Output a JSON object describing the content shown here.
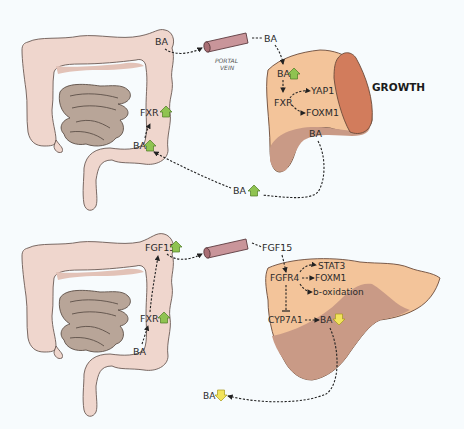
{
  "figure": {
    "top_panel": {
      "intestine_labels": {
        "ba_top": "BA",
        "fxr": "FXR",
        "ba_lower": "BA"
      },
      "portal_vein": {
        "line1": "PORTAL",
        "line2": "VEIN"
      },
      "vein_output_label": "BA",
      "liver_labels": {
        "ba_in": "BA",
        "fxr": "FXR",
        "yap1": "YAP1",
        "foxm1": "FOXM1",
        "ba_out": "BA"
      },
      "recirculation_label": "BA",
      "outcome": "GROWTH",
      "indicators": {
        "intestine_fxr": "up",
        "intestine_ba": "up",
        "liver_ba": "up",
        "recirculating_ba": "up"
      }
    },
    "bottom_panel": {
      "intestine_labels": {
        "fgf15": "FGF15",
        "fxr": "FXR",
        "ba": "BA"
      },
      "vein_output_label": "FGF15",
      "liver_labels": {
        "fgfr4": "FGFR4",
        "stat3": "STAT3",
        "foxm1": "FOXM1",
        "b_oxidation": "b-oxidation",
        "cyp7a1": "CYP7A1",
        "ba": "BA"
      },
      "excretion_label": "BA",
      "indicators": {
        "fgf15": "up",
        "fxr": "up",
        "liver_ba": "down",
        "excreted_ba": "down"
      }
    },
    "icons": [
      "colon-icon",
      "small-intestine-icon",
      "portal-vein-icon",
      "liver-icon",
      "up-arrow-icon",
      "down-arrow-icon",
      "inhibition-icon"
    ],
    "colors": {
      "up_arrow": "#8fc351",
      "down_arrow": "#f2e35c",
      "liver": "#f3c49a",
      "liver_cut": "#d27c5c",
      "colon": "#efd6cd",
      "small_intestine": "#b8a598",
      "vein": "#c9959a"
    }
  }
}
